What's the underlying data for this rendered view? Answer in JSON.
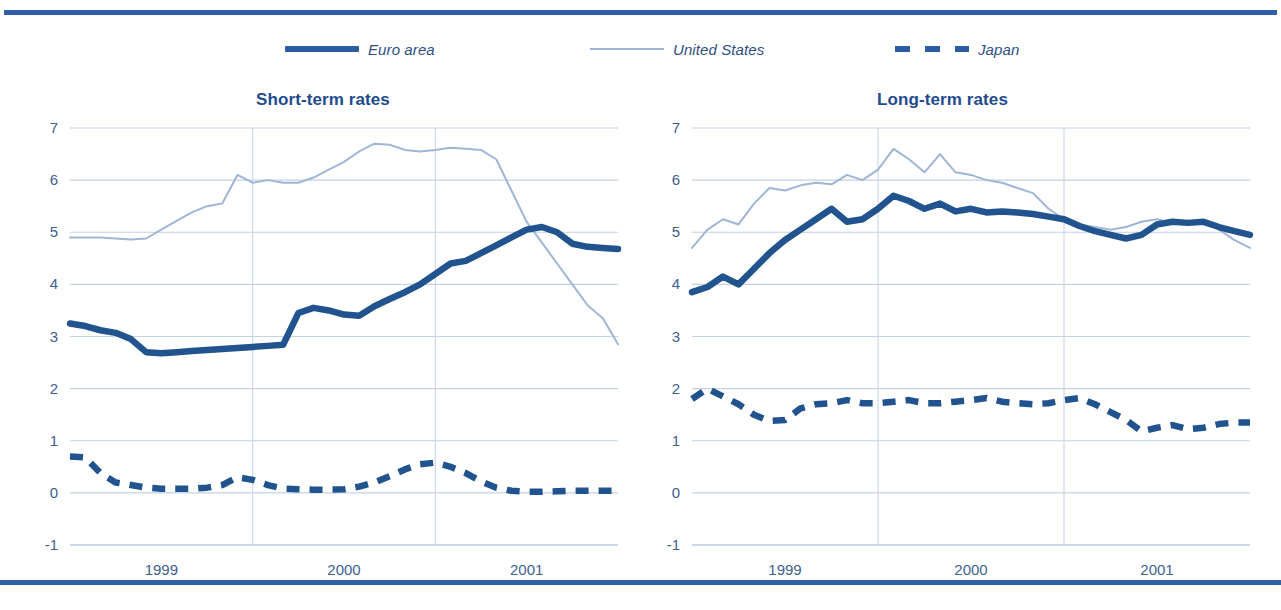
{
  "figure": {
    "accent_color": "#2f5fa8",
    "euro_color": "#21548f",
    "us_color": "#9fb6d6",
    "japan_color": "#21548f"
  },
  "legend": {
    "items": [
      {
        "label": "Euro area",
        "style": "solid-thick",
        "color": "#2b5da5"
      },
      {
        "label": "United States",
        "style": "thin",
        "color": "#9db4d4"
      },
      {
        "label": "Japan",
        "style": "dashed-thick",
        "color": "#2b5da5"
      }
    ]
  },
  "chart_data": [
    {
      "type": "line",
      "title": "Short-term rates",
      "xlabel": "",
      "ylabel": "",
      "ylim": [
        -1,
        7
      ],
      "yticks": [
        -1,
        0,
        1,
        2,
        3,
        4,
        5,
        6,
        7
      ],
      "xticks": [
        "1999",
        "2000",
        "2001"
      ],
      "xtick_positions": [
        6,
        18,
        30
      ],
      "grid": true,
      "legend_position": "top-center",
      "x": [
        0,
        1,
        2,
        3,
        4,
        5,
        6,
        7,
        8,
        9,
        10,
        11,
        12,
        13,
        14,
        15,
        16,
        17,
        18,
        19,
        20,
        21,
        22,
        23,
        24,
        25,
        26,
        27,
        28,
        29,
        30,
        31,
        32,
        33,
        34,
        35,
        36
      ],
      "series": [
        {
          "name": "Euro area",
          "values": [
            3.25,
            3.2,
            3.12,
            3.07,
            2.95,
            2.7,
            2.68,
            2.7,
            2.72,
            2.74,
            2.76,
            2.78,
            2.8,
            2.82,
            2.84,
            3.45,
            3.55,
            3.5,
            3.42,
            3.4,
            3.58,
            3.72,
            3.85,
            4.0,
            4.2,
            4.4,
            4.45,
            4.6,
            4.75,
            4.9,
            5.05,
            5.1,
            5.0,
            4.78,
            4.72,
            4.7,
            4.68
          ]
        },
        {
          "name": "United States",
          "values": [
            4.9,
            4.9,
            4.9,
            4.88,
            4.86,
            4.88,
            5.05,
            5.22,
            5.38,
            5.5,
            5.55,
            6.1,
            5.95,
            6.0,
            5.95,
            5.95,
            6.05,
            6.2,
            6.35,
            6.55,
            6.7,
            6.68,
            6.58,
            6.55,
            6.58,
            6.62,
            6.6,
            6.58,
            6.4,
            5.8,
            5.2,
            4.8,
            4.4,
            4.0,
            3.6,
            3.35,
            2.85
          ]
        },
        {
          "name": "Japan",
          "values": [
            0.7,
            0.68,
            0.38,
            0.2,
            0.15,
            0.1,
            0.08,
            0.08,
            0.08,
            0.1,
            0.15,
            0.3,
            0.25,
            0.15,
            0.08,
            0.07,
            0.06,
            0.06,
            0.07,
            0.12,
            0.2,
            0.32,
            0.45,
            0.55,
            0.58,
            0.5,
            0.38,
            0.22,
            0.1,
            0.04,
            0.02,
            0.02,
            0.03,
            0.04,
            0.04,
            0.04,
            0.04
          ]
        }
      ]
    },
    {
      "type": "line",
      "title": "Long-term rates",
      "xlabel": "",
      "ylabel": "",
      "ylim": [
        -1,
        7
      ],
      "yticks": [
        -1,
        0,
        1,
        2,
        3,
        4,
        5,
        6,
        7
      ],
      "xticks": [
        "1999",
        "2000",
        "2001"
      ],
      "xtick_positions": [
        6,
        18,
        30
      ],
      "grid": true,
      "legend_position": "top-center",
      "x": [
        0,
        1,
        2,
        3,
        4,
        5,
        6,
        7,
        8,
        9,
        10,
        11,
        12,
        13,
        14,
        15,
        16,
        17,
        18,
        19,
        20,
        21,
        22,
        23,
        24,
        25,
        26,
        27,
        28,
        29,
        30,
        31,
        32,
        33,
        34,
        35,
        36
      ],
      "series": [
        {
          "name": "Euro area",
          "values": [
            3.85,
            3.95,
            4.15,
            4.0,
            4.3,
            4.6,
            4.85,
            5.05,
            5.25,
            5.45,
            5.2,
            5.25,
            5.45,
            5.7,
            5.6,
            5.45,
            5.55,
            5.4,
            5.45,
            5.38,
            5.4,
            5.38,
            5.35,
            5.3,
            5.25,
            5.12,
            5.02,
            4.95,
            4.88,
            4.95,
            5.15,
            5.2,
            5.18,
            5.2,
            5.1,
            5.02,
            4.95
          ]
        },
        {
          "name": "United States",
          "values": [
            4.7,
            5.05,
            5.25,
            5.15,
            5.55,
            5.85,
            5.8,
            5.9,
            5.95,
            5.92,
            6.1,
            6.0,
            6.2,
            6.6,
            6.4,
            6.15,
            6.5,
            6.15,
            6.1,
            6.0,
            5.95,
            5.85,
            5.75,
            5.45,
            5.25,
            5.15,
            5.1,
            5.05,
            5.1,
            5.2,
            5.25,
            5.18,
            5.22,
            5.2,
            5.05,
            4.85,
            4.7
          ]
        },
        {
          "name": "Japan",
          "values": [
            1.8,
            2.0,
            1.85,
            1.7,
            1.5,
            1.38,
            1.4,
            1.62,
            1.7,
            1.72,
            1.78,
            1.72,
            1.72,
            1.75,
            1.78,
            1.72,
            1.72,
            1.75,
            1.78,
            1.82,
            1.75,
            1.72,
            1.7,
            1.72,
            1.78,
            1.82,
            1.7,
            1.55,
            1.4,
            1.18,
            1.25,
            1.3,
            1.22,
            1.25,
            1.32,
            1.35,
            1.35
          ]
        }
      ]
    }
  ]
}
